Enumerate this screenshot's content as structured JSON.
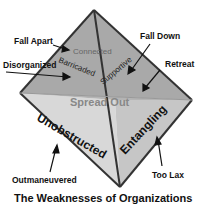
{
  "diagram": {
    "title": "The Weaknesses of Organizations",
    "faces": {
      "back": "Spread Out",
      "left": "Unobstructed",
      "right": "Entangling"
    },
    "edges": {
      "top": "Connected",
      "left_upper": "Barricaded",
      "right_upper": "Supportive"
    },
    "callouts": [
      {
        "label": "Fall Apart"
      },
      {
        "label": "Disorganized"
      },
      {
        "label": "Fall Down"
      },
      {
        "label": "Retreat"
      },
      {
        "label": "Outmaneuvered"
      },
      {
        "label": "Too Lax"
      }
    ],
    "colors": {
      "face_back": "#a9a9a9",
      "face_left": "#d6d6d6",
      "face_right": "#c4c4c4",
      "edge": "#333333"
    }
  }
}
